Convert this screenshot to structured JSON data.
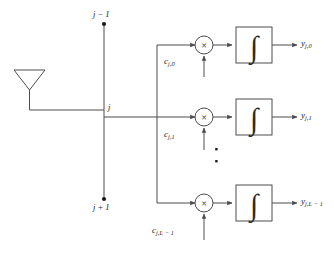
{
  "figure": {
    "type": "block-diagram",
    "background_color": "#ffffff",
    "line_color": "#4d4d4d",
    "text_color": "#1a1a1a"
  },
  "antenna": {
    "name": "antenna",
    "shape": "inverted-triangle-with-stem"
  },
  "bus": {
    "name": "vertical-tap-bus",
    "top_node_label": "j − 1",
    "center_node_label": "j",
    "bottom_node_label": "j + 1"
  },
  "branches": [
    {
      "index": 0,
      "coefficient": {
        "base": "c",
        "sub": "j,0"
      },
      "multiplier_symbol": "×",
      "integrator_symbol": "∫",
      "output": {
        "base": "y",
        "sub": "j,0"
      }
    },
    {
      "index": 1,
      "coefficient": {
        "base": "c",
        "sub": "j,1"
      },
      "multiplier_symbol": "×",
      "integrator_symbol": "∫",
      "output": {
        "base": "y",
        "sub": "j,1"
      }
    },
    {
      "index": 2,
      "coefficient": {
        "base": "c",
        "sub": "j,L − 1"
      },
      "multiplier_symbol": "×",
      "integrator_symbol": "∫",
      "output": {
        "base": "y",
        "sub": "j,L − 1"
      }
    }
  ],
  "ellipsis": {
    "name": "vertical-ellipsis",
    "dot_count": 2
  }
}
